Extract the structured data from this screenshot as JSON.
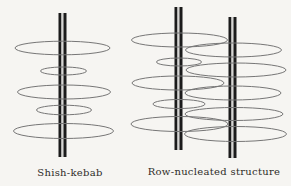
{
  "figure": {
    "background": "#f6f5f2",
    "ellipse_stroke": "#767676",
    "rod_color": "#1b1b1b",
    "rod_core_color": "#d6d6d4",
    "text_color": "#2e2c28",
    "diagrams": [
      {
        "name": "shish-kebab",
        "label": "Shish-kebab",
        "label_cx": 70,
        "label_top": 167,
        "rods": [
          {
            "cx": 62.5,
            "top": 13,
            "bottom": 157
          }
        ],
        "ellipses": [
          {
            "cx": 62.5,
            "cy": 48,
            "rx": 47.5,
            "ry": 6.8
          },
          {
            "cx": 63.5,
            "cy": 71,
            "rx": 23,
            "ry": 4
          },
          {
            "cx": 64,
            "cy": 92,
            "rx": 46.5,
            "ry": 7
          },
          {
            "cx": 64,
            "cy": 110,
            "rx": 27.5,
            "ry": 4.8
          },
          {
            "cx": 63.5,
            "cy": 131,
            "rx": 50,
            "ry": 7.5
          }
        ]
      },
      {
        "name": "row-nucleated-structure",
        "label": "Row-nucleated structure",
        "label_cx": 214,
        "label_top": 166,
        "rods": [
          {
            "cx": 178.5,
            "top": 7,
            "bottom": 150
          },
          {
            "cx": 232.5,
            "top": 17,
            "bottom": 158
          }
        ],
        "ellipses": [
          {
            "cx": 179.5,
            "cy": 40,
            "rx": 48,
            "ry": 7
          },
          {
            "cx": 233.5,
            "cy": 50,
            "rx": 48,
            "ry": 7
          },
          {
            "cx": 179,
            "cy": 62,
            "rx": 22.5,
            "ry": 4
          },
          {
            "cx": 236,
            "cy": 70,
            "rx": 50,
            "ry": 7
          },
          {
            "cx": 178,
            "cy": 83,
            "rx": 46,
            "ry": 7
          },
          {
            "cx": 233,
            "cy": 93,
            "rx": 48,
            "ry": 7
          },
          {
            "cx": 179,
            "cy": 104,
            "rx": 26,
            "ry": 4.5
          },
          {
            "cx": 234,
            "cy": 114,
            "rx": 49,
            "ry": 6.5
          },
          {
            "cx": 179.5,
            "cy": 124,
            "rx": 48.5,
            "ry": 7.5
          },
          {
            "cx": 235.5,
            "cy": 134,
            "rx": 51,
            "ry": 7.5
          }
        ]
      }
    ]
  }
}
